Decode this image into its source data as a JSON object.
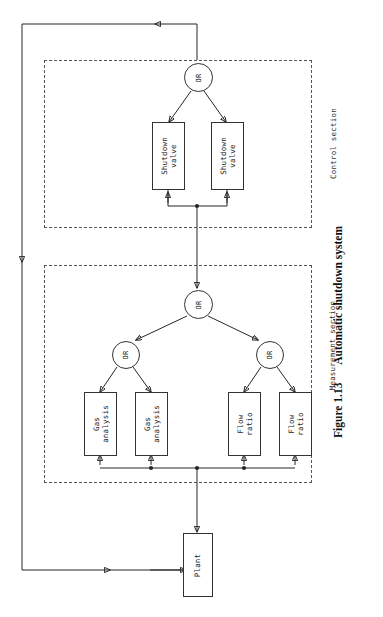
{
  "caption": {
    "number": "Figure 1.13",
    "text": "Automatic shutdown system"
  },
  "sections": [
    {
      "id": "control",
      "label": "Control section"
    },
    {
      "id": "measurement",
      "label": "Measurement section"
    }
  ],
  "gates": [
    {
      "id": "gate-control-top",
      "label": "OR"
    },
    {
      "id": "gate-measurement-top",
      "label": "OR"
    },
    {
      "id": "gate-measurement-left",
      "label": "OR"
    },
    {
      "id": "gate-measurement-right",
      "label": "OR"
    }
  ],
  "blocks": [
    {
      "id": "shutdown-valve-1",
      "label": "Shutdown\nvalve"
    },
    {
      "id": "shutdown-valve-2",
      "label": "Shutdown\nvalve"
    },
    {
      "id": "gas-analysis-1",
      "label": "Gas\nanalysis"
    },
    {
      "id": "gas-analysis-2",
      "label": "Gas\nanalysis"
    },
    {
      "id": "flow-ratio-1",
      "label": "Flow\nratio"
    },
    {
      "id": "flow-ratio-2",
      "label": "Flow\nratio"
    },
    {
      "id": "plant",
      "label": "Plant"
    }
  ],
  "colors": {
    "ink": "#262626",
    "dash": "#555555",
    "paper": "#ffffff"
  }
}
